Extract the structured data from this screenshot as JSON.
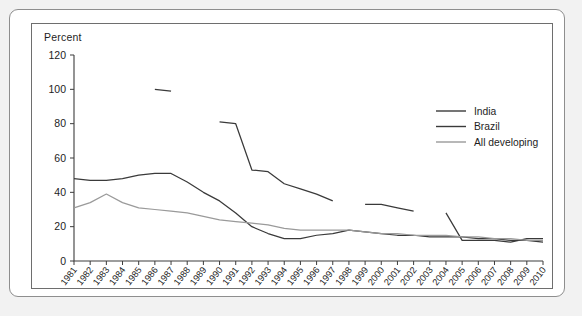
{
  "axis_label": "Percent",
  "legend": {
    "position": "top-right",
    "entries": [
      {
        "label": "India",
        "color": "#3a3a3a"
      },
      {
        "label": "Brazil",
        "color": "#3a3a3a"
      },
      {
        "label": "All developing",
        "color": "#9a9a9a"
      }
    ]
  },
  "chart_data": {
    "type": "line",
    "title": "",
    "xlabel": "",
    "ylabel": "Percent",
    "ylim": [
      0,
      120
    ],
    "yticks": [
      0,
      20,
      40,
      60,
      80,
      100,
      120
    ],
    "grid": false,
    "legend_position": "top-right",
    "categories": [
      "1981",
      "1982",
      "1983",
      "1984",
      "1985",
      "1986",
      "1987",
      "1988",
      "1989",
      "1990",
      "1991",
      "1992",
      "1993",
      "1994",
      "1995",
      "1996",
      "1997",
      "1998",
      "1999",
      "2000",
      "2001",
      "2002",
      "2003",
      "2004",
      "2005",
      "2006",
      "2007",
      "2008",
      "2009",
      "2010"
    ],
    "series": [
      {
        "name": "India",
        "color": "#3a3a3a",
        "values": [
          48,
          47,
          47,
          48,
          50,
          51,
          51,
          46,
          40,
          35,
          28,
          20,
          16,
          13,
          13,
          15,
          16,
          18,
          17,
          16,
          15,
          15,
          14,
          14,
          14,
          13,
          13,
          12,
          12,
          11
        ]
      },
      {
        "name": "Brazil",
        "color": "#3a3a3a",
        "values": [
          null,
          null,
          null,
          null,
          null,
          100,
          99,
          null,
          null,
          81,
          80,
          53,
          52,
          45,
          42,
          39,
          35,
          null,
          33,
          33,
          31,
          29,
          null,
          28,
          12,
          12,
          12,
          11,
          13,
          13
        ]
      },
      {
        "name": "All developing",
        "color": "#9a9a9a",
        "values": [
          31,
          34,
          39,
          34,
          31,
          30,
          29,
          28,
          26,
          24,
          23,
          22,
          21,
          19,
          18,
          18,
          18,
          18,
          17,
          16,
          16,
          15,
          15,
          15,
          14,
          14,
          13,
          13,
          12,
          12
        ]
      }
    ]
  }
}
